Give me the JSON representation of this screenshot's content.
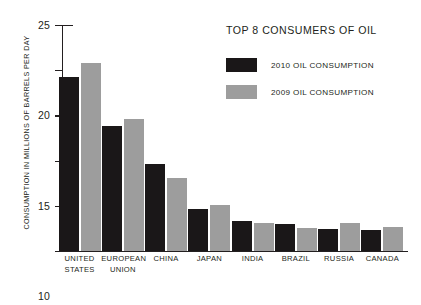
{
  "chart_data": {
    "type": "bar",
    "title": "TOP 8 CONSUMERS OF OIL",
    "xlabel": "",
    "ylabel": "CONSUMPTION IN MILLIONS OF BARRELS PER DAY",
    "ylim": [
      0,
      25
    ],
    "yticks": [
      0,
      5,
      10,
      15,
      20,
      25
    ],
    "ytick_labels": [
      "0",
      "5",
      "10",
      "15",
      "20",
      "25"
    ],
    "grid": false,
    "legend_position": "top-right",
    "categories": [
      "UNITED STATES",
      "EUROPEAN UNION",
      "CHINA",
      "JAPAN",
      "INDIA",
      "BRAZIL",
      "RUSSIA",
      "CANADA"
    ],
    "category_lines": [
      [
        "UNITED",
        "STATES"
      ],
      [
        "EUROPEAN",
        "UNION"
      ],
      [
        "CHINA"
      ],
      [
        "JAPAN"
      ],
      [
        "INDIA"
      ],
      [
        "BRAZIL"
      ],
      [
        "RUSSIA"
      ],
      [
        "CANADA"
      ]
    ],
    "series": [
      {
        "name": "2010 OIL CONSUMPTION",
        "color": "#1a1718",
        "values": [
          19.2,
          13.8,
          9.6,
          4.6,
          3.3,
          3.0,
          2.4,
          2.3
        ]
      },
      {
        "name": "2009 OIL CONSUMPTION",
        "color": "#9d9d9d",
        "values": [
          20.8,
          14.6,
          8.1,
          5.1,
          3.1,
          2.5,
          3.1,
          2.7
        ]
      }
    ]
  },
  "legend": {
    "items": [
      {
        "label": "2010 OIL CONSUMPTION",
        "color": "#1a1718"
      },
      {
        "label": "2009 OIL CONSUMPTION",
        "color": "#9d9d9d"
      }
    ]
  },
  "colors": {
    "series_2010": "#1a1718",
    "series_2009": "#9d9d9d",
    "axis": "#231f20",
    "background": "#ffffff"
  }
}
